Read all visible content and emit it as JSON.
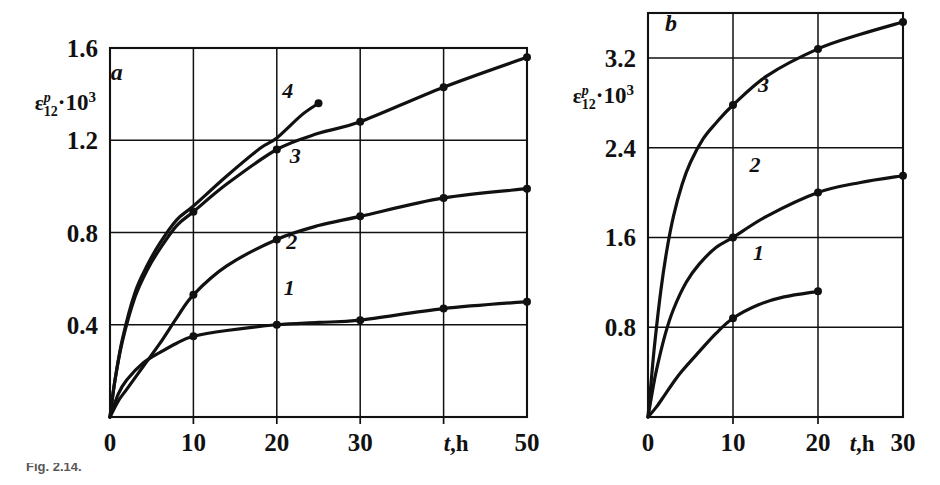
{
  "figure": {
    "caption": "Fig. 2.14.",
    "panels": [
      "a",
      "b"
    ]
  },
  "panel_a": {
    "label": "a",
    "y_axis_title": {
      "base": "ε",
      "sup": "p",
      "sub": "12",
      "factor": "·10",
      "factor_exp": "3"
    },
    "x_axis_title": {
      "italic": "t",
      "rest": ",h"
    },
    "y_ticks": [
      "0.4",
      "0.8",
      "1.2",
      "1.6"
    ],
    "x_ticks": [
      "0",
      "10",
      "20",
      "30",
      "50"
    ],
    "curve_labels": [
      "1",
      "2",
      "3",
      "4"
    ]
  },
  "panel_b": {
    "label": "b",
    "y_axis_title": {
      "base": "ε",
      "sup": "p",
      "sub": "12",
      "factor": "·10",
      "factor_exp": "3"
    },
    "x_axis_title": {
      "italic": "t",
      "rest": ",h"
    },
    "y_ticks": [
      "0.8",
      "1.6",
      "2.4",
      "3.2"
    ],
    "x_ticks": [
      "0",
      "10",
      "20",
      "30"
    ],
    "curve_labels": [
      "1",
      "2",
      "3"
    ]
  },
  "chart_data": [
    {
      "type": "line",
      "panel": "a",
      "title": "",
      "xlabel": "t,h",
      "ylabel": "εᵖ₁₂·10³",
      "xlim": [
        0,
        50
      ],
      "ylim": [
        0,
        1.6
      ],
      "xticks": [
        0,
        10,
        20,
        30,
        40,
        50
      ],
      "xticklabels": [
        "0",
        "10",
        "20",
        "30",
        "",
        "50"
      ],
      "yticks": [
        0.4,
        0.8,
        1.2,
        1.6
      ],
      "grid": true,
      "legend": "inline-curve-numbers",
      "series": [
        {
          "name": "1",
          "markers_x": [
            10,
            20,
            30,
            40,
            50
          ],
          "markers_y": [
            0.35,
            0.4,
            0.42,
            0.47,
            0.5
          ],
          "x": [
            0,
            1,
            2,
            4,
            6,
            8,
            10,
            14,
            20,
            25,
            30,
            40,
            50
          ],
          "y": [
            0,
            0.1,
            0.16,
            0.235,
            0.28,
            0.32,
            0.35,
            0.375,
            0.4,
            0.41,
            0.42,
            0.47,
            0.5
          ]
        },
        {
          "name": "2",
          "markers_x": [
            10,
            20,
            30,
            40,
            50
          ],
          "markers_y": [
            0.53,
            0.77,
            0.87,
            0.95,
            0.99
          ],
          "x": [
            0,
            1,
            2,
            4,
            6,
            8,
            10,
            14,
            20,
            25,
            30,
            40,
            50
          ],
          "y": [
            0,
            0.07,
            0.12,
            0.22,
            0.32,
            0.43,
            0.53,
            0.655,
            0.77,
            0.83,
            0.87,
            0.95,
            0.99
          ]
        },
        {
          "name": "3",
          "markers_x": [
            10,
            20,
            30,
            40,
            50
          ],
          "markers_y": [
            0.89,
            1.16,
            1.28,
            1.43,
            1.56
          ],
          "x": [
            0,
            0.6,
            1.5,
            3,
            4.5,
            6,
            8,
            10,
            14,
            20,
            25,
            30,
            40,
            50
          ],
          "y": [
            0,
            0.16,
            0.33,
            0.52,
            0.64,
            0.73,
            0.83,
            0.89,
            1.01,
            1.16,
            1.23,
            1.28,
            1.43,
            1.56
          ]
        },
        {
          "name": "4",
          "markers_x": [
            25
          ],
          "markers_y": [
            1.36
          ],
          "x": [
            0,
            0.6,
            1.5,
            3,
            4.5,
            6,
            8,
            10,
            14,
            18,
            20,
            23,
            25
          ],
          "y": [
            0,
            0.16,
            0.34,
            0.54,
            0.66,
            0.755,
            0.855,
            0.915,
            1.045,
            1.165,
            1.21,
            1.31,
            1.36
          ]
        }
      ]
    },
    {
      "type": "line",
      "panel": "b",
      "title": "",
      "xlabel": "t,h",
      "ylabel": "εᵖ₁₂·10³",
      "xlim": [
        0,
        30
      ],
      "ylim": [
        0,
        3.6
      ],
      "xticks": [
        0,
        10,
        20,
        30
      ],
      "xticklabels": [
        "0",
        "10",
        "20",
        "30"
      ],
      "yticks": [
        0.8,
        1.6,
        2.4,
        3.2
      ],
      "grid": true,
      "legend": "inline-curve-numbers",
      "series": [
        {
          "name": "1",
          "markers_x": [
            10,
            20
          ],
          "markers_y": [
            0.88,
            1.12
          ],
          "x": [
            0,
            1,
            2,
            3,
            4,
            6,
            8,
            10,
            13,
            16,
            20
          ],
          "y": [
            0,
            0.09,
            0.2,
            0.31,
            0.41,
            0.58,
            0.745,
            0.88,
            1.0,
            1.07,
            1.12
          ]
        },
        {
          "name": "2",
          "markers_x": [
            10,
            20,
            30
          ],
          "markers_y": [
            1.6,
            2.0,
            2.15
          ],
          "x": [
            0,
            0.5,
            1,
            2,
            3,
            4.5,
            6,
            8,
            10,
            14,
            20,
            25,
            30
          ],
          "y": [
            0,
            0.22,
            0.42,
            0.73,
            0.96,
            1.2,
            1.36,
            1.51,
            1.6,
            1.79,
            2.0,
            2.09,
            2.15
          ]
        },
        {
          "name": "3",
          "markers_x": [
            10,
            20,
            30
          ],
          "markers_y": [
            2.78,
            3.28,
            3.52
          ],
          "x": [
            0,
            0.4,
            0.8,
            1.5,
            2.2,
            3,
            4,
            5,
            6.5,
            8,
            10,
            14,
            20,
            25,
            30
          ],
          "y": [
            0,
            0.34,
            0.66,
            1.12,
            1.48,
            1.79,
            2.07,
            2.27,
            2.48,
            2.62,
            2.78,
            3.04,
            3.28,
            3.41,
            3.52
          ]
        }
      ]
    }
  ]
}
